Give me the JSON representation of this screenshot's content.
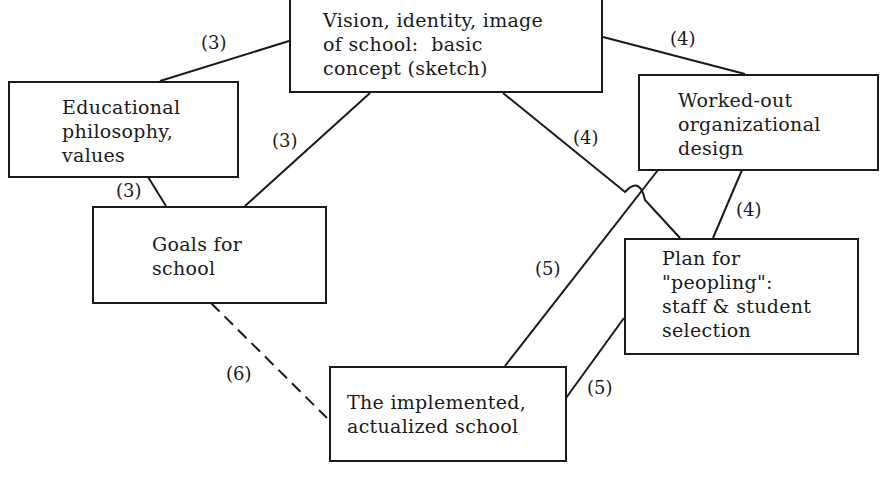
{
  "diagram": {
    "nodes": {
      "vision": "Vision, identity, image\nof school:  basic\nconcept (sketch)",
      "philosophy": "Educational\nphilosophy,\nvalues",
      "design": "Worked-out\norganizational\ndesign",
      "goals": "Goals for\nschool",
      "peopling": "Plan for\n\"peopling\":\nstaff & student\nselection",
      "implemented": "The implemented,\nactualized school"
    },
    "edge_labels": {
      "vision_philosophy": "(3)",
      "vision_design": "(4)",
      "vision_goals": "(3)",
      "philosophy_goals": "(3)",
      "vision_peopling": "(4)",
      "design_peopling": "(4)",
      "design_implemented": "(5)",
      "peopling_implemented": "(5)",
      "goals_implemented": "(6)"
    },
    "edges": [
      {
        "from": "vision",
        "to": "philosophy",
        "label": "(3)",
        "style": "solid"
      },
      {
        "from": "vision",
        "to": "design",
        "label": "(4)",
        "style": "solid"
      },
      {
        "from": "vision",
        "to": "goals",
        "label": "(3)",
        "style": "solid"
      },
      {
        "from": "philosophy",
        "to": "goals",
        "label": "(3)",
        "style": "solid"
      },
      {
        "from": "vision",
        "to": "peopling",
        "label": "(4)",
        "style": "solid"
      },
      {
        "from": "design",
        "to": "peopling",
        "label": "(4)",
        "style": "solid"
      },
      {
        "from": "design",
        "to": "implemented",
        "label": "(5)",
        "style": "solid"
      },
      {
        "from": "peopling",
        "to": "implemented",
        "label": "(5)",
        "style": "solid"
      },
      {
        "from": "goals",
        "to": "implemented",
        "label": "(6)",
        "style": "dashed"
      }
    ]
  }
}
